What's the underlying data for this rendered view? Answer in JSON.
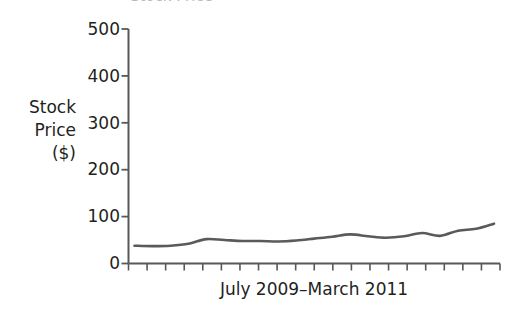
{
  "figure": {
    "title_clipped": "Stock Price",
    "background_color": "#ffffff"
  },
  "axis": {
    "y_label_line1": "Stock",
    "y_label_line2": "Price",
    "y_label_line3": "($)",
    "x_label": "July 2009–March 2011",
    "y_ticks": [
      "500",
      "400",
      "300",
      "200",
      "100",
      "0"
    ],
    "axis_color": "#58585a",
    "text_color": "#231f20"
  },
  "chart_data": {
    "type": "line",
    "title": "Stock Price",
    "xlabel": "July 2009–March 2011",
    "ylabel": "Stock Price ($)",
    "ylim": [
      0,
      500
    ],
    "yticks": [
      0,
      100,
      200,
      300,
      400,
      500
    ],
    "grid": false,
    "legend": null,
    "line_color": "#5a5a5a",
    "line_width": 2.6,
    "x_tick_count": 21,
    "x": [
      "Jul 2009",
      "Aug 2009",
      "Sep 2009",
      "Oct 2009",
      "Nov 2009",
      "Dec 2009",
      "Jan 2010",
      "Feb 2010",
      "Mar 2010",
      "Apr 2010",
      "May 2010",
      "Jun 2010",
      "Jul 2010",
      "Aug 2010",
      "Sep 2010",
      "Oct 2010",
      "Nov 2010",
      "Dec 2010",
      "Jan 2011",
      "Feb 2011",
      "Mar 2011"
    ],
    "series": [
      {
        "name": "Stock Price",
        "values": [
          38,
          37,
          38,
          42,
          52,
          50,
          48,
          48,
          47,
          49,
          53,
          57,
          62,
          58,
          55,
          58,
          65,
          59,
          70,
          74,
          85
        ]
      }
    ]
  }
}
